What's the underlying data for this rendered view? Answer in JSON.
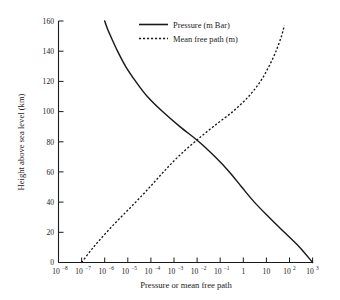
{
  "chart_data": {
    "type": "line",
    "title": "",
    "xlabel": "Pressure or mean free path",
    "ylabel": "Height above sea level (km)",
    "xscale": "log",
    "xlim": [
      1e-08,
      1000
    ],
    "ylim": [
      0,
      160
    ],
    "grid": false,
    "legend_position": "top-center",
    "x_tick_labels": [
      {
        "base": "10",
        "exp": "−8"
      },
      {
        "base": "10",
        "exp": "−7"
      },
      {
        "base": "10",
        "exp": "−6"
      },
      {
        "base": "10",
        "exp": "−5"
      },
      {
        "base": "10",
        "exp": "−4"
      },
      {
        "base": "10",
        "exp": "−3"
      },
      {
        "base": "10",
        "exp": "−2"
      },
      {
        "base": "10",
        "exp": "−1"
      },
      {
        "base": "1",
        "exp": ""
      },
      {
        "base": "10",
        "exp": ""
      },
      {
        "base": "10",
        "exp": "2"
      },
      {
        "base": "10",
        "exp": "3"
      }
    ],
    "x_tick_values": [
      1e-08,
      1e-07,
      1e-06,
      1e-05,
      0.0001,
      0.001,
      0.01,
      0.1,
      1,
      10,
      100,
      1000
    ],
    "y_tick_labels": [
      "0",
      "20",
      "40",
      "60",
      "80",
      "100",
      "120",
      "140",
      "160"
    ],
    "y_tick_values": [
      0,
      20,
      40,
      60,
      80,
      100,
      120,
      140,
      160
    ],
    "series": [
      {
        "name": "Pressure (m Bar)",
        "style": "solid",
        "xlabel_axis": "Pressure (m Bar)",
        "y": [
          0,
          10,
          20,
          30,
          40,
          50,
          60,
          70,
          80,
          90,
          100,
          110,
          120,
          130,
          140,
          150,
          155,
          160
        ],
        "x": [
          1000,
          280,
          60,
          13,
          3.0,
          0.85,
          0.25,
          0.06,
          0.012,
          0.0018,
          0.00032,
          7e-05,
          2.2e-05,
          8e-06,
          3.6e-06,
          1.8e-06,
          1.3e-06,
          1e-06
        ]
      },
      {
        "name": "Mean free path (m)",
        "style": "dashed",
        "y": [
          0,
          10,
          20,
          30,
          40,
          50,
          60,
          70,
          80,
          90,
          100,
          110,
          120,
          130,
          140,
          150,
          157
        ],
        "x": [
          1e-07,
          3.2e-07,
          1.2e-06,
          5e-06,
          2.2e-05,
          9e-05,
          0.00035,
          0.0015,
          0.008,
          0.05,
          0.35,
          1.7,
          5.5,
          13,
          26,
          45,
          60
        ]
      }
    ],
    "crossing_point": {
      "x": 0.006,
      "y": 83
    }
  },
  "legend": {
    "items": [
      {
        "label": "Pressure (m Bar)",
        "style": "solid"
      },
      {
        "label": "Mean free path (m)",
        "style": "dashed"
      }
    ]
  },
  "axes": {
    "x_title": "Pressure or mean free path",
    "y_title": "Height above sea level (km)"
  }
}
